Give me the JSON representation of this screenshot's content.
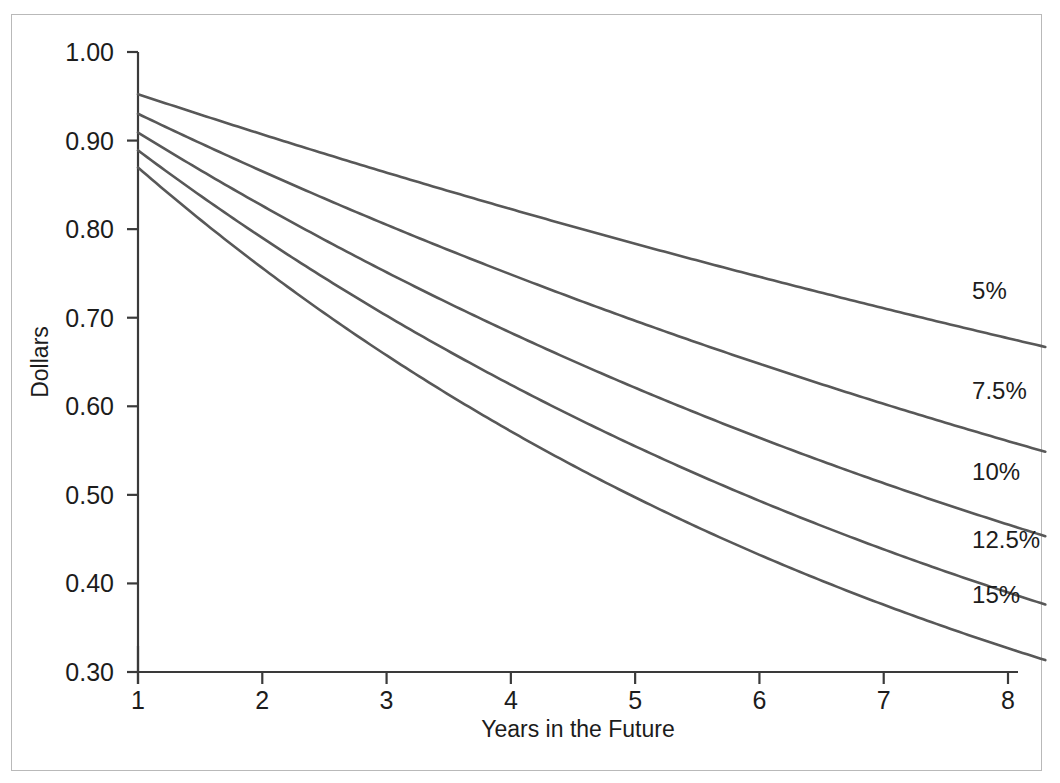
{
  "chart_data": {
    "type": "line",
    "title": "",
    "xlabel": "Years in the Future",
    "ylabel": "Dollars",
    "xlim": [
      1,
      8.3
    ],
    "ylim": [
      0.3,
      1.0
    ],
    "grid": false,
    "legend_position": "right-inline-labels",
    "xticks": [
      "1",
      "2",
      "3",
      "4",
      "5",
      "6",
      "7",
      "8"
    ],
    "xtick_values": [
      1,
      2,
      3,
      4,
      5,
      6,
      7,
      8
    ],
    "yticks": [
      "1.00",
      "0.90",
      "0.80",
      "0.70",
      "0.60",
      "0.50",
      "0.40",
      "0.30"
    ],
    "ytick_values": [
      1.0,
      0.9,
      0.8,
      0.7,
      0.6,
      0.5,
      0.4,
      0.3
    ],
    "x": [
      1,
      2,
      3,
      4,
      5,
      6,
      7,
      8,
      8.3
    ],
    "series": [
      {
        "name": "5%",
        "rate": 0.05,
        "label": "5%",
        "values": [
          0.952,
          0.907,
          0.864,
          0.823,
          0.784,
          0.746,
          0.711,
          0.677,
          0.668
        ]
      },
      {
        "name": "7.5%",
        "rate": 0.075,
        "label": "7.5%",
        "values": [
          0.93,
          0.865,
          0.805,
          0.749,
          0.697,
          0.648,
          0.603,
          0.561,
          0.549
        ]
      },
      {
        "name": "10%",
        "rate": 0.1,
        "label": "10%",
        "values": [
          0.909,
          0.826,
          0.751,
          0.683,
          0.621,
          0.564,
          0.513,
          0.467,
          0.454
        ]
      },
      {
        "name": "12.5%",
        "rate": 0.125,
        "label": "12.5%",
        "values": [
          0.889,
          0.79,
          0.702,
          0.624,
          0.555,
          0.493,
          0.438,
          0.39,
          0.376
        ]
      },
      {
        "name": "15%",
        "rate": 0.15,
        "label": "15%",
        "values": [
          0.87,
          0.756,
          0.658,
          0.572,
          0.497,
          0.432,
          0.376,
          0.327,
          0.314
        ]
      }
    ],
    "colors": {
      "curve": "#585858",
      "axis": "#3a3a3a",
      "text": "#1c1c1c",
      "border": "#b9b9b9",
      "background": "#ffffff"
    }
  }
}
